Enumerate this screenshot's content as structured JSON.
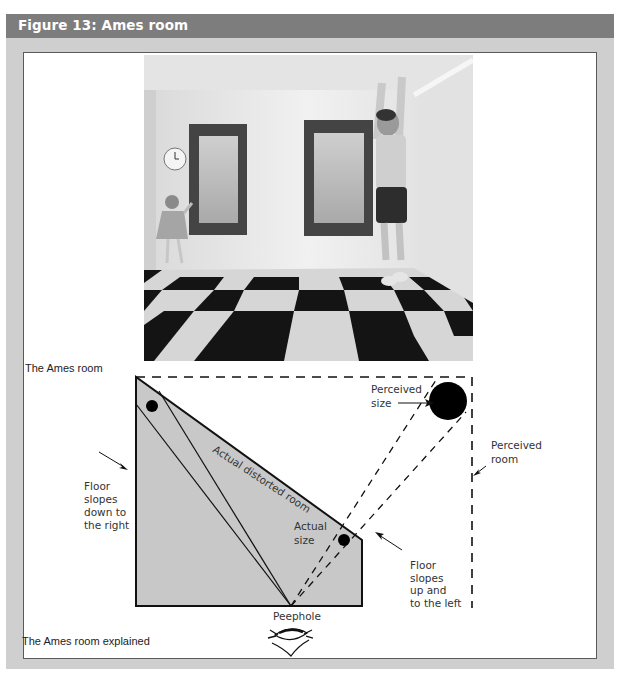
{
  "figure": {
    "title": "Figure 13: Ames room",
    "colors": {
      "title_bar": "#7d7d7d",
      "frame": "#cfcfcf",
      "panel": "#ffffff",
      "room_fill": "#c8c8c8",
      "ink": "#111111"
    }
  },
  "photo": {
    "caption": "The Ames room",
    "description": "Photograph of an Ames room: a small girl stands on the left beside a window-like panel and wall clock; a taller-looking boy stands on the right with arms raised touching the ceiling; black and white checkerboard floor."
  },
  "diagram": {
    "caption": "The Ames room explained",
    "labels": {
      "actual_room": "Actual distorted room",
      "perceived_size": [
        "Perceived",
        "size"
      ],
      "perceived_room": [
        "Perceived",
        "room"
      ],
      "actual_size": [
        "Actual",
        "size"
      ],
      "floor_left": [
        "Floor",
        "slopes",
        "down to",
        "the right"
      ],
      "floor_right": [
        "Floor",
        "slopes",
        "up and",
        "to the left"
      ],
      "peephole": "Peephole"
    }
  }
}
